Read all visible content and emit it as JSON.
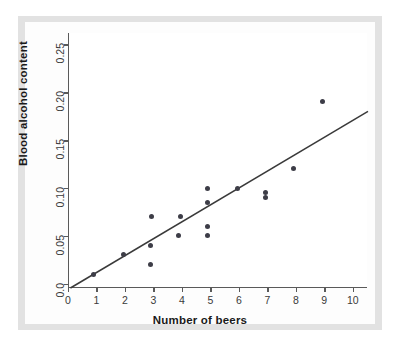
{
  "chart_data": {
    "type": "scatter",
    "title": "",
    "xlabel": "Number of beers",
    "ylabel": "Blood alcohol content",
    "xlim": [
      0,
      10.5
    ],
    "ylim": [
      -0.0045,
      0.262
    ],
    "xticks": [
      0,
      1,
      2,
      3,
      4,
      5,
      6,
      7,
      8,
      9,
      10
    ],
    "xticklabels": [
      "0",
      "1",
      "2",
      "3",
      "4",
      "5",
      "6",
      "7",
      "8",
      "9",
      "10"
    ],
    "yticks": [
      0.0,
      0.05,
      0.1,
      0.15,
      0.2,
      0.25
    ],
    "yticklabels": [
      "0.0",
      "0.05",
      "0.10",
      "0.15",
      "0.20",
      "0.25"
    ],
    "grid": false,
    "legend": null,
    "marker_color": "#3d3d47",
    "line_color": "#3a3a3a",
    "axis_color": "#5a5a5a",
    "points": [
      {
        "x": 0.85,
        "y": 0.01
      },
      {
        "x": 1.9,
        "y": 0.03
      },
      {
        "x": 2.85,
        "y": 0.02
      },
      {
        "x": 2.85,
        "y": 0.04
      },
      {
        "x": 2.9,
        "y": 0.07
      },
      {
        "x": 3.85,
        "y": 0.05
      },
      {
        "x": 3.9,
        "y": 0.07
      },
      {
        "x": 4.85,
        "y": 0.05
      },
      {
        "x": 4.85,
        "y": 0.06
      },
      {
        "x": 4.85,
        "y": 0.085
      },
      {
        "x": 4.85,
        "y": 0.1
      },
      {
        "x": 5.9,
        "y": 0.1
      },
      {
        "x": 6.9,
        "y": 0.09
      },
      {
        "x": 6.9,
        "y": 0.095
      },
      {
        "x": 7.9,
        "y": 0.12
      },
      {
        "x": 8.9,
        "y": 0.19
      }
    ],
    "fit_line": {
      "type": "linear-regression",
      "x_start": 0.05,
      "y_start": -0.0045,
      "x_end": 10.5,
      "y_end": 0.18
    }
  },
  "figure": {
    "background": "#ffffff",
    "mount_color": "#e2e2e2",
    "card_color": "#fdfdfd"
  }
}
